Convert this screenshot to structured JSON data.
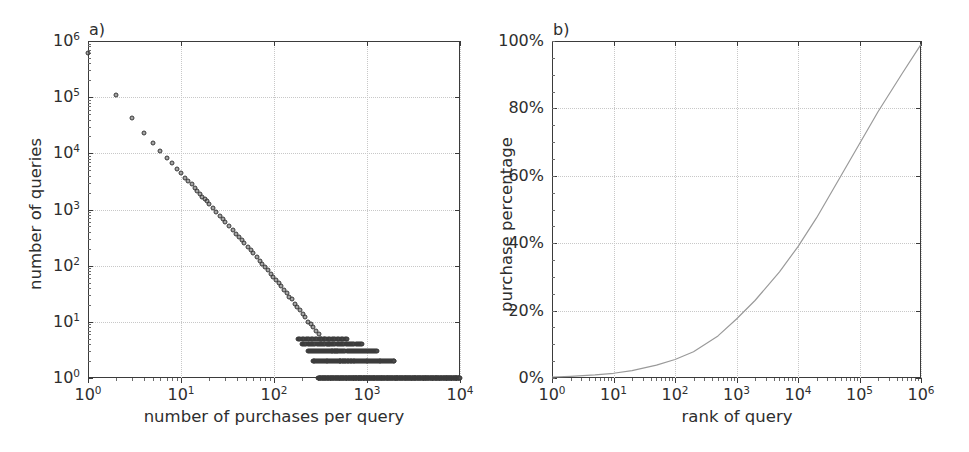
{
  "figure": {
    "width": 969,
    "height": 452,
    "background": "#ffffff",
    "axis_color": "#3b3b3b",
    "grid_color": "#c8c8c8",
    "text_color": "#2e2e2e",
    "marker_color": "#3a3a3a",
    "line_color": "#9a9a9a"
  },
  "panels": [
    {
      "tag": "a)",
      "name": "panel-a",
      "xlabel": "number of purchases per query",
      "ylabel": "number of queries",
      "xticks": [
        "10",
        "10",
        "10",
        "10",
        "10"
      ],
      "xtick_exps": [
        "0",
        "1",
        "2",
        "3",
        "4"
      ],
      "yticks": [
        "10",
        "10",
        "10",
        "10",
        "10",
        "10",
        "10"
      ],
      "ytick_exps": [
        "0",
        "1",
        "2",
        "3",
        "4",
        "5",
        "6"
      ]
    },
    {
      "tag": "b)",
      "name": "panel-b",
      "xlabel": "rank of query",
      "ylabel": "purchase percentage",
      "xticks": [
        "10",
        "10",
        "10",
        "10",
        "10",
        "10",
        "10"
      ],
      "xtick_exps": [
        "0",
        "1",
        "2",
        "3",
        "4",
        "5",
        "6"
      ],
      "yticks": [
        "0%",
        "20%",
        "40%",
        "60%",
        "80%",
        "100%"
      ]
    }
  ],
  "chart_data": [
    {
      "type": "scatter",
      "panel": "a)",
      "title": "",
      "xlabel": "number of purchases per query",
      "ylabel": "number of queries",
      "xscale": "log",
      "yscale": "log",
      "xlim": [
        1,
        10000
      ],
      "ylim": [
        1,
        1000000
      ],
      "grid": true,
      "legend": "none",
      "marker": "open-circle",
      "description": "Heavy-tailed power-law distribution: number of queries vs number of purchases per query. Starts near 6e5 at x=1, falls roughly as a power law to a dense floor of 1-5 queries for x above 200.",
      "points": [
        [
          1,
          600000
        ],
        [
          2,
          110000
        ],
        [
          3,
          43000
        ],
        [
          4,
          23000
        ],
        [
          5,
          15000
        ],
        [
          6,
          11000
        ],
        [
          7,
          8300
        ],
        [
          8,
          6600
        ],
        [
          9,
          5300
        ],
        [
          10,
          4400
        ],
        [
          11,
          3700
        ],
        [
          12,
          3200
        ],
        [
          13,
          2800
        ],
        [
          14,
          2450
        ],
        [
          15,
          2150
        ],
        [
          16,
          1900
        ],
        [
          17,
          1700
        ],
        [
          18,
          1530
        ],
        [
          19,
          1390
        ],
        [
          20,
          1270
        ],
        [
          22,
          1060
        ],
        [
          24,
          900
        ],
        [
          26,
          780
        ],
        [
          28,
          680
        ],
        [
          30,
          600
        ],
        [
          33,
          505
        ],
        [
          36,
          430
        ],
        [
          39,
          370
        ],
        [
          42,
          322
        ],
        [
          45,
          283
        ],
        [
          48,
          250
        ],
        [
          52,
          216
        ],
        [
          56,
          188
        ],
        [
          60,
          165
        ],
        [
          65,
          142
        ],
        [
          70,
          123
        ],
        [
          75,
          108
        ],
        [
          80,
          95
        ],
        [
          86,
          83
        ],
        [
          92,
          72
        ],
        [
          98,
          64
        ],
        [
          105,
          56
        ],
        [
          112,
          49
        ],
        [
          120,
          43
        ],
        [
          128,
          37
        ],
        [
          137,
          32
        ],
        [
          146,
          28
        ],
        [
          156,
          25
        ],
        [
          167,
          21
        ],
        [
          178,
          18
        ],
        [
          190,
          16
        ],
        [
          203,
          14
        ],
        [
          217,
          12
        ],
        [
          232,
          10
        ],
        [
          248,
          9
        ],
        [
          265,
          8
        ],
        [
          283,
          7
        ],
        [
          302,
          6
        ],
        [
          323,
          5
        ],
        [
          345,
          5
        ],
        [
          369,
          4
        ],
        [
          394,
          4
        ],
        [
          421,
          3
        ],
        [
          450,
          3
        ],
        [
          480,
          3
        ],
        [
          513,
          2
        ],
        [
          548,
          2
        ],
        [
          586,
          2
        ],
        [
          626,
          2
        ],
        [
          669,
          2
        ],
        [
          715,
          1
        ],
        [
          764,
          1
        ],
        [
          816,
          1
        ],
        [
          872,
          1
        ],
        [
          932,
          1
        ],
        [
          996,
          1
        ],
        [
          1064,
          1
        ],
        [
          1200,
          1
        ],
        [
          1400,
          1
        ],
        [
          1700,
          1
        ],
        [
          2100,
          1
        ],
        [
          2600,
          1
        ],
        [
          3300,
          1
        ],
        [
          4200,
          1
        ],
        [
          5500,
          1
        ],
        [
          7200,
          1
        ],
        [
          9000,
          1
        ]
      ],
      "floor_levels": [
        1,
        2,
        3,
        4,
        5
      ],
      "notes": "Discrete integer counts produce horizontal bands at y=1,2,3,4,5; y=1 band extends across the full x-range to 10^4."
    },
    {
      "type": "line",
      "panel": "b)",
      "title": "",
      "xlabel": "rank of query",
      "ylabel": "purchase percentage",
      "xscale": "log",
      "yscale": "linear",
      "xlim": [
        1,
        1000000
      ],
      "ylim": [
        0,
        100
      ],
      "grid": true,
      "legend": "none",
      "description": "Cumulative purchase percentage versus query rank (log x). Monotonically increasing S-like curve reaching ~98-100% at rank 10^6.",
      "x": [
        1,
        2,
        5,
        10,
        20,
        50,
        100,
        200,
        500,
        1000,
        2000,
        5000,
        10000,
        20000,
        50000,
        100000,
        200000,
        500000,
        1000000
      ],
      "y": [
        0.3,
        0.5,
        0.9,
        1.4,
        2.2,
        3.8,
        5.5,
        7.8,
        12.5,
        17.5,
        23.0,
        31.5,
        39.0,
        47.5,
        60.0,
        69.5,
        79.0,
        90.5,
        99.0
      ]
    }
  ]
}
